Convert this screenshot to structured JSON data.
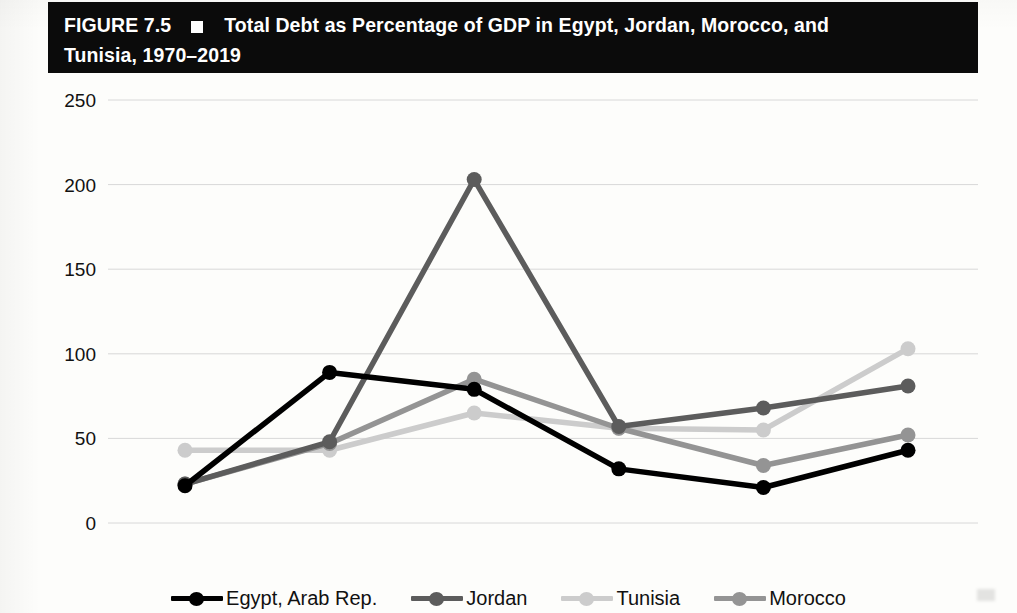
{
  "figure": {
    "label": "FIGURE 7.5",
    "marker_icon": "white-square-bullet",
    "title_line1": "Total Debt as Percentage of GDP in Egypt, Jordan, Morocco, and",
    "title_line2": "Tunisia, 1970–2019",
    "header_bg": "#0b0b0b",
    "header_fg": "#ffffff"
  },
  "chart_data": {
    "type": "line",
    "title": "Total Debt as Percentage of GDP in Egypt, Jordan, Morocco, and Tunisia, 1970–2019",
    "xlabel": "",
    "ylabel": "",
    "categories": [
      "1970",
      "1980",
      "1990",
      "2000",
      "2010",
      "2019"
    ],
    "x": [
      1970,
      1980,
      1990,
      2000,
      2010,
      2019
    ],
    "ylim": [
      0,
      250
    ],
    "yticks": [
      0,
      50,
      100,
      150,
      200,
      250
    ],
    "grid": true,
    "legend_position": "bottom",
    "series": [
      {
        "name": "Egypt, Arab Rep.",
        "color": "#000000",
        "values": [
          22,
          89,
          79,
          32,
          21,
          43
        ]
      },
      {
        "name": "Jordan",
        "color": "#5c5c5c",
        "values": [
          23,
          48,
          203,
          57,
          68,
          81
        ]
      },
      {
        "name": "Tunisia",
        "color": "#cccccc",
        "values": [
          43,
          43,
          65,
          56,
          55,
          103
        ]
      },
      {
        "name": "Morocco",
        "color": "#949494",
        "values": [
          23,
          47,
          85,
          56,
          34,
          52
        ]
      }
    ]
  },
  "axis": {
    "ytick_labels": [
      "250",
      "200",
      "150",
      "100",
      "50",
      "0"
    ],
    "xtick_labels": [
      "1970",
      "1980",
      "1990",
      "2000",
      "2010",
      "2019"
    ]
  },
  "legend": {
    "items": [
      {
        "label": "Egypt, Arab Rep.",
        "color": "#000000"
      },
      {
        "label": "Jordan",
        "color": "#5c5c5c"
      },
      {
        "label": "Tunisia",
        "color": "#cccccc"
      },
      {
        "label": "Morocco",
        "color": "#949494"
      }
    ]
  }
}
